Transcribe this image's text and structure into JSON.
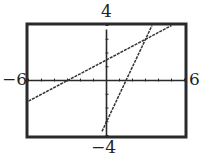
{
  "chart_data": {
    "type": "line",
    "title": "",
    "xlabel": "",
    "ylabel": "",
    "xlim": [
      -6,
      6
    ],
    "ylim": [
      -4,
      4
    ],
    "x_tick_step": 1,
    "y_tick_step": 1,
    "grid": false,
    "window_labels": {
      "xmin": "−6",
      "xmax": "6",
      "ymin": "−4",
      "ymax": "4"
    },
    "series": [
      {
        "name": "line-1",
        "description": "shallow increasing line (approx. y = 0.5x + 1.5)",
        "slope": 0.5,
        "intercept": 1.5,
        "x": [
          -6,
          -3,
          0,
          3,
          5
        ],
        "y": [
          -1.5,
          0,
          1.5,
          3,
          4.0
        ]
      },
      {
        "name": "line-2",
        "description": "steep increasing line (approx. y = 2x - 3)",
        "slope": 2,
        "intercept": -3,
        "x": [
          -0.35,
          0,
          1.5,
          3,
          3.5
        ],
        "y": [
          -3.7,
          -3,
          0,
          3,
          4.0
        ]
      }
    ],
    "intersection": {
      "x": 3,
      "y": 3
    }
  }
}
